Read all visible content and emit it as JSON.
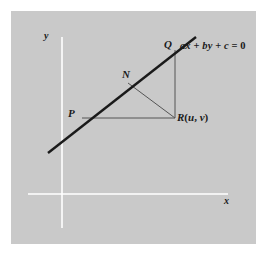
{
  "figure": {
    "background_color": "#ffffff",
    "panel_color": "#c9c9c9",
    "ink_color": "#1a1a1a",
    "axis_color": "#ffffff",
    "thin_line_color": "#555555"
  },
  "axes": {
    "x_label": "x",
    "y_label": "y",
    "origin": [
      62,
      194
    ],
    "x_axis_from": [
      28,
      194
    ],
    "x_axis_to": [
      228,
      194
    ],
    "y_axis_from": [
      62,
      37
    ],
    "y_axis_to": [
      62,
      228
    ]
  },
  "line": {
    "equation": {
      "a": "a",
      "x": "x",
      "plus1": "+",
      "b": "b",
      "y": "y",
      "plus2": "+",
      "c": "c",
      "equals": "=",
      "zero": "0",
      "full": "ax + by + c = 0"
    },
    "from": [
      48,
      153
    ],
    "to": [
      196,
      37
    ]
  },
  "points": {
    "P": {
      "label": "P",
      "at": [
        82,
        118
      ]
    },
    "Q": {
      "label": "Q",
      "at": [
        175,
        50
      ]
    },
    "N": {
      "label": "N",
      "at": [
        128,
        83
      ]
    },
    "R": {
      "name": "R",
      "open_paren": "(",
      "u": "u",
      "comma": ",",
      "v": "v",
      "close_paren": ")",
      "full": "R(u, v)",
      "at": [
        175,
        118
      ]
    }
  },
  "segments": [
    {
      "name": "segment-PR",
      "from": [
        82,
        118
      ],
      "to": [
        175,
        118
      ]
    },
    {
      "name": "segment-QR",
      "from": [
        175,
        50
      ],
      "to": [
        175,
        118
      ]
    },
    {
      "name": "segment-NR",
      "from": [
        128,
        83
      ],
      "to": [
        175,
        118
      ]
    }
  ]
}
